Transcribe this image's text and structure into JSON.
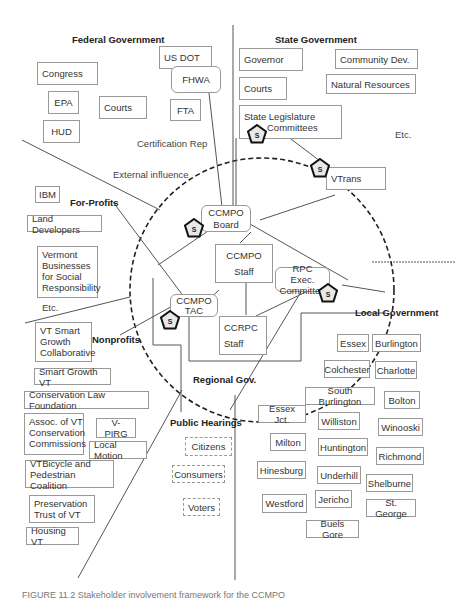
{
  "diagram": {
    "sections": {
      "federal": "Federal Government",
      "state": "State Government",
      "for_profits": "For-Profits",
      "nonprofits": "Nonprofits",
      "regional": "Regional Gov.",
      "public_hearings": "Public Hearings",
      "local": "Local Government"
    },
    "federal_boxes": [
      "Congress",
      "EPA",
      "HUD",
      "Courts",
      "US DOT",
      "FHWA",
      "FTA"
    ],
    "federal_labels": {
      "cert_rep": "Certification Rep",
      "external": "External influence"
    },
    "state_boxes": [
      "Governor",
      "Courts",
      "Community Dev.",
      "Natural Resources",
      "State Legislature",
      "Committees",
      "VTrans"
    ],
    "state_etc": "Etc.",
    "for_profit_boxes": [
      "IBM",
      "Land Developers",
      "Vermont Businesses for Social Responsibility"
    ],
    "for_profit_etc": "Etc.",
    "regional_boxes": {
      "board": [
        "CCMPO",
        "Board"
      ],
      "staff": [
        "CCMPO",
        "Staff"
      ],
      "tac": [
        "CCMPO",
        "TAC"
      ],
      "ccrpc": [
        "CCRPC",
        "Staff"
      ],
      "rpc": [
        "RPC Exec.",
        "Committee"
      ]
    },
    "nonprofit_boxes": [
      "VT Smart Growth Collaborative",
      "Smart Growth VT",
      "Conservation Law Foundation",
      "Assoc. of VT Conservation Commissions",
      "V-PIRG",
      "Local Motion",
      "VTBicycle and Pedestrian Coalition",
      "Preservation Trust of VT",
      "Housing VT"
    ],
    "public_boxes": [
      "Citizens",
      "Consumers",
      "Voters"
    ],
    "local_boxes": [
      "Essex",
      "Burlington",
      "Colchester",
      "Charlotte",
      "South Burlington",
      "Bolton",
      "Essex Jct.",
      "Williston",
      "Winooski",
      "Milton",
      "Huntington",
      "Richmond",
      "Hinesburg",
      "Underhill",
      "Shelburne",
      "Westford",
      "Jericho",
      "St. George",
      "Buels Gore"
    ],
    "stakeholder_symbol": "S",
    "caption": "FIGURE 11.2 Stakeholder involvement framework for the CCMPO"
  }
}
